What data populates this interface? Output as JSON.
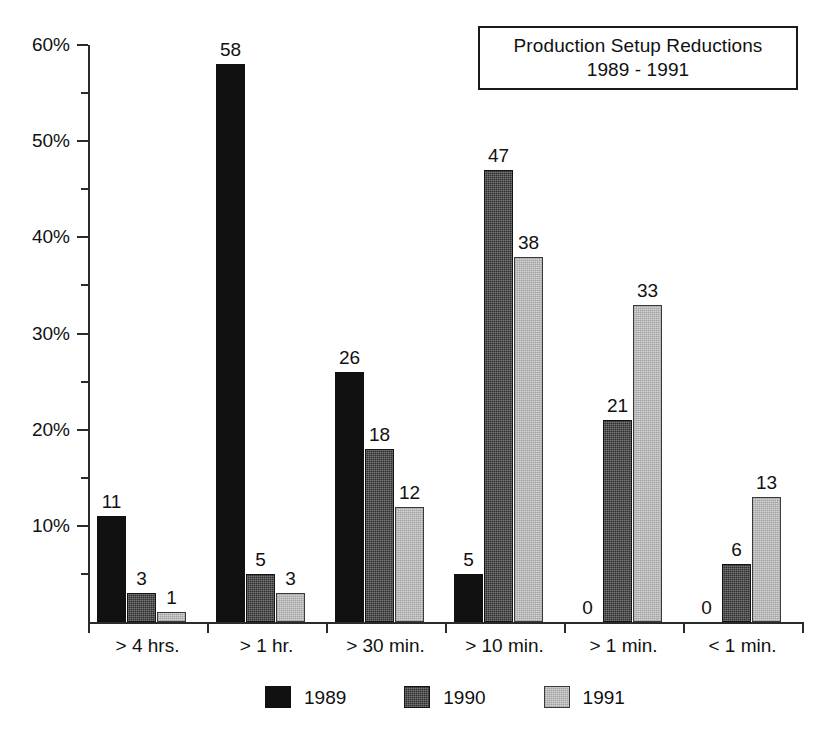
{
  "title": {
    "line1": "Production Setup Reductions",
    "line2": "1989 - 1991"
  },
  "chart_data": {
    "type": "bar",
    "title": "Production Setup Reductions 1989 - 1991",
    "subtitle": "1989 - 1991",
    "xlabel": "",
    "ylabel": "",
    "categories": [
      "> 4 hrs.",
      "> 1 hr.",
      "> 30 min.",
      "> 10 min.",
      "> 1 min.",
      "< 1 min."
    ],
    "series": [
      {
        "name": "1989",
        "color": "#111111",
        "values": [
          11,
          58,
          26,
          5,
          0,
          0
        ]
      },
      {
        "name": "1990",
        "color": "#2f2f2f",
        "values": [
          3,
          5,
          18,
          47,
          21,
          6
        ]
      },
      {
        "name": "1991",
        "color": "#d2d2d2",
        "values": [
          1,
          3,
          12,
          38,
          33,
          13
        ]
      }
    ],
    "value_labels": true,
    "ylim": [
      0,
      62
    ],
    "ytick_labels": [
      "10%",
      "20%",
      "30%",
      "40%",
      "50%",
      "60%"
    ],
    "ytick_values": [
      10,
      20,
      30,
      40,
      50,
      60
    ],
    "yminor_values": [
      5,
      15,
      25,
      35,
      45,
      55
    ],
    "grid": false,
    "legend_position": "bottom"
  },
  "legend": {
    "items": [
      {
        "label": "1989"
      },
      {
        "label": "1990"
      },
      {
        "label": "1991"
      }
    ]
  }
}
